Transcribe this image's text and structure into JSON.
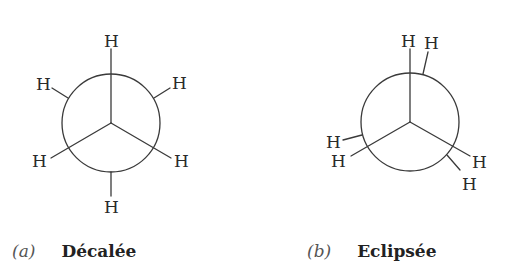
{
  "figures": [
    {
      "id": "a",
      "tag": "(a)",
      "name": "Décalée",
      "conformation": "staggered",
      "atoms": [
        "H",
        "H",
        "H",
        "H",
        "H",
        "H"
      ]
    },
    {
      "id": "b",
      "tag": "(b)",
      "name": "Eclipsée",
      "conformation": "eclipsed",
      "atoms": [
        "H",
        "H",
        "H",
        "H",
        "H",
        "H"
      ]
    }
  ],
  "colors": {
    "ink": "#2a2a2a",
    "background": "#ffffff"
  }
}
